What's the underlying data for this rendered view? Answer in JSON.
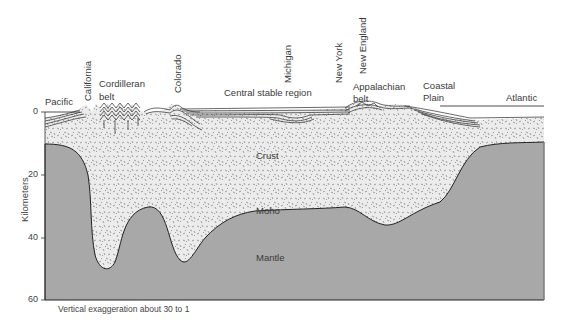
{
  "figure": {
    "caption": "Vertical exaggeration about 30 to 1",
    "y_axis": {
      "label": "Kilometers",
      "ticks": [
        "0",
        "20",
        "40",
        "60"
      ]
    },
    "regions": {
      "crust": "Crust",
      "moho": "Moho",
      "mantle": "Mantle"
    },
    "surface_labels": {
      "pacific": "Pacific",
      "california": "California",
      "cordilleran_1": "Cordilleran",
      "cordilleran_2": "belt",
      "colorado": "Colorado",
      "central": "Central stable region",
      "michigan": "Michigan",
      "new_york": "New York",
      "new_england": "New England",
      "appalachian_1": "Appalachian",
      "appalachian_2": "belt",
      "coastal_1": "Coastal",
      "coastal_2": "Plain",
      "atlantic": "Atlantic"
    },
    "colors": {
      "mantle": "#a8a8a8",
      "crust": "#ececec",
      "stipple": "#7a7a7a",
      "lines": "#2a2a2a"
    }
  }
}
